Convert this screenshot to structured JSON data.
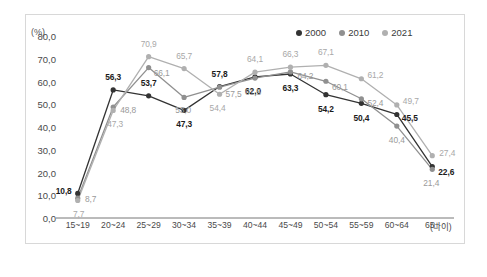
{
  "chart_data": {
    "type": "line",
    "title": "",
    "xlabel": "(나이)",
    "ylabel": "(%)",
    "ylim": [
      0,
      80
    ],
    "yticks": [
      "0.0",
      "10.0",
      "20.0",
      "30.0",
      "40.0",
      "50.0",
      "60.0",
      "70.0",
      "80.0"
    ],
    "grid": false,
    "legend_position": "top-right",
    "categories": [
      "15~19",
      "20~24",
      "25~29",
      "30~34",
      "35~39",
      "40~44",
      "45~49",
      "50~54",
      "55~59",
      "60~64",
      "65+"
    ],
    "series": [
      {
        "name": "2000",
        "color": "#333333",
        "values": [
          10.8,
          56.3,
          53.7,
          47.3,
          57.8,
          62.0,
          63.3,
          54.2,
          50.4,
          45.5,
          22.6
        ],
        "labels": [
          "10.8",
          "56.3",
          "53.7",
          "47.3",
          "57.8",
          "62.0",
          "63.3",
          "54.2",
          "50.4",
          "45.5",
          "22.6"
        ]
      },
      {
        "name": "2010",
        "color": "#909090",
        "values": [
          8.7,
          48.8,
          66.1,
          53.0,
          57.5,
          61.5,
          64.2,
          60.1,
          52.4,
          40.4,
          21.4
        ],
        "labels": [
          "8.7",
          "48.8",
          "66.1",
          "53.0",
          "57.5",
          "61.5",
          "64.2",
          "60.1",
          "52.4",
          "40.4",
          "21.4"
        ]
      },
      {
        "name": "2021",
        "color": "#b0b0b0",
        "values": [
          7.7,
          47.3,
          70.9,
          65.7,
          54.4,
          64.1,
          66.3,
          67.1,
          61.2,
          49.7,
          27.4
        ],
        "labels": [
          "7.7",
          "47.3",
          "70.9",
          "65.7",
          "54.4",
          "64.1",
          "66.3",
          "67.1",
          "61.2",
          "49.7",
          "27.4"
        ]
      }
    ],
    "label_offsets": {
      "2000": [
        [
          -14,
          -2
        ],
        [
          0,
          -13
        ],
        [
          0,
          -13
        ],
        [
          0,
          14
        ],
        [
          0,
          -13
        ],
        [
          -2,
          14
        ],
        [
          0,
          14
        ],
        [
          0,
          14
        ],
        [
          0,
          15
        ],
        [
          13,
          4
        ],
        [
          14,
          5
        ]
      ],
      "2010": [
        [
          13,
          1
        ],
        [
          15,
          3
        ],
        [
          13,
          5
        ],
        [
          -1,
          13
        ],
        [
          14,
          7
        ],
        [
          -2,
          14
        ],
        [
          15,
          4
        ],
        [
          14,
          6
        ],
        [
          14,
          4
        ],
        [
          0,
          14
        ],
        [
          -1,
          14
        ]
      ],
      "2021": [
        [
          1,
          14
        ],
        [
          2,
          14
        ],
        [
          0,
          -13
        ],
        [
          0,
          -13
        ],
        [
          -2,
          14
        ],
        [
          0,
          -13
        ],
        [
          0,
          -13
        ],
        [
          0,
          -13
        ],
        [
          14,
          -4
        ],
        [
          14,
          -4
        ],
        [
          15,
          -3
        ]
      ]
    }
  }
}
